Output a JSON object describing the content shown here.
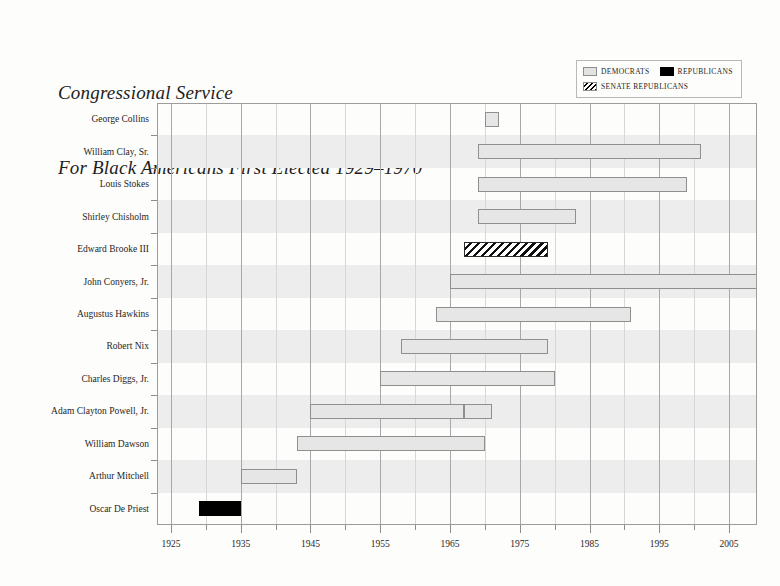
{
  "title": {
    "line1": "Congressional Service",
    "line2": "For Black Americans First Elected 1929–1970"
  },
  "legend": {
    "items": [
      {
        "label": "Democrats",
        "style": "dem",
        "color": "#e2e2e2"
      },
      {
        "label": "Republicans",
        "style": "rep",
        "color": "#000000"
      },
      {
        "label": "Senate Republicans",
        "style": "senrep",
        "color": "#000000"
      }
    ]
  },
  "chart_data": {
    "type": "bar",
    "orientation": "horizontal",
    "subtype": "gantt",
    "title": "Congressional Service For Black Americans First Elected 1929–1970",
    "xlabel": "",
    "ylabel": "",
    "xlim": [
      1923,
      2009
    ],
    "xticks_major": [
      1925,
      1935,
      1945,
      1955,
      1965,
      1975,
      1985,
      1995,
      2005
    ],
    "xticks_minor": [
      1930,
      1940,
      1950,
      1960,
      1970,
      1980,
      1990,
      2000
    ],
    "xtick_labels": [
      "1925",
      "1935",
      "1945",
      "1955",
      "1965",
      "1975",
      "1985",
      "1995",
      "2005"
    ],
    "grid": true,
    "legend_position": "top-right",
    "categories": [
      "George Collins",
      "William Clay, Sr.",
      "Louis Stokes",
      "Shirley Chisholm",
      "Edward Brooke III",
      "John Conyers, Jr.",
      "Augustus Hawkins",
      "Robert Nix",
      "Charles Diggs, Jr.",
      "Adam Clayton Powell, Jr.",
      "William Dawson",
      "Arthur Mitchell",
      "Oscar De Priest"
    ],
    "bars": [
      {
        "name": "George Collins",
        "party": "dem",
        "start": 1970,
        "end": 1972,
        "ongoing": false
      },
      {
        "name": "William Clay, Sr.",
        "party": "dem",
        "start": 1969,
        "end": 2001,
        "ongoing": false
      },
      {
        "name": "Louis Stokes",
        "party": "dem",
        "start": 1969,
        "end": 1999,
        "ongoing": false
      },
      {
        "name": "Shirley Chisholm",
        "party": "dem",
        "start": 1969,
        "end": 1983,
        "ongoing": false
      },
      {
        "name": "Edward Brooke III",
        "party": "senrep",
        "start": 1967,
        "end": 1979,
        "ongoing": false
      },
      {
        "name": "John Conyers, Jr.",
        "party": "dem",
        "start": 1965,
        "end": 2009,
        "ongoing": true
      },
      {
        "name": "Augustus Hawkins",
        "party": "dem",
        "start": 1963,
        "end": 1991,
        "ongoing": false
      },
      {
        "name": "Robert Nix",
        "party": "dem",
        "start": 1958,
        "end": 1979,
        "ongoing": false
      },
      {
        "name": "Charles Diggs, Jr.",
        "party": "dem",
        "start": 1955,
        "end": 1980,
        "ongoing": false
      },
      {
        "name": "Adam Clayton Powell, Jr.",
        "party": "dem",
        "start": 1945,
        "end": 1967,
        "ongoing": false
      },
      {
        "name": "Adam Clayton Powell, Jr.",
        "party": "dem",
        "start": 1967,
        "end": 1971,
        "ongoing": false
      },
      {
        "name": "William Dawson",
        "party": "dem",
        "start": 1943,
        "end": 1970,
        "ongoing": false
      },
      {
        "name": "Arthur Mitchell",
        "party": "dem",
        "start": 1935,
        "end": 1943,
        "ongoing": false
      },
      {
        "name": "Oscar De Priest",
        "party": "rep",
        "start": 1929,
        "end": 1935,
        "ongoing": false
      }
    ],
    "bar_rows": [
      0,
      1,
      2,
      3,
      4,
      5,
      6,
      7,
      8,
      9,
      9,
      10,
      11,
      12
    ]
  }
}
